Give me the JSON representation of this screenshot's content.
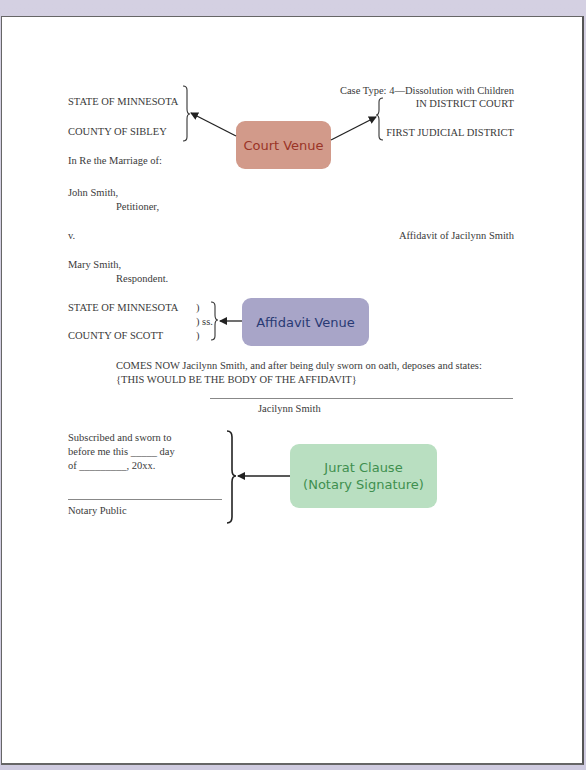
{
  "caption": {
    "case_type": "Case Type: 4—Dissolution with Children",
    "court": "IN DISTRICT COURT",
    "district": "FIRST JUDICIAL DISTRICT",
    "state": "STATE OF MINNESOTA",
    "county": "COUNTY OF SIBLEY",
    "in_re": "In Re the Marriage of:",
    "petitioner_name": "John Smith,",
    "petitioner_role": "Petitioner,",
    "versus": "v.",
    "respondent_name": "Mary Smith,",
    "respondent_role": "Respondent.",
    "document_title": "Affidavit of Jacilynn Smith"
  },
  "affidavit_venue": {
    "state": "STATE OF MINNESOTA",
    "county": "COUNTY OF SCOTT",
    "paren_top": ")",
    "ss": ") ss.",
    "paren_bottom": ")"
  },
  "body": {
    "line1": "COMES NOW Jacilynn Smith, and after being duly sworn on oath, deposes and states:",
    "line2": "{THIS WOULD BE THE BODY OF THE AFFIDAVIT}",
    "signer": "Jacilynn Smith"
  },
  "jurat": {
    "line1": "Subscribed and sworn to",
    "line2": "before me this _____ day",
    "line3": "of _________, 20xx.",
    "notary": "Notary Public"
  },
  "callouts": {
    "court_venue": "Court Venue",
    "affidavit_venue": "Affidavit Venue",
    "jurat_line1": "Jurat Clause",
    "jurat_line2": "(Notary Signature)"
  },
  "colors": {
    "court_venue_bg": "#d29a8a",
    "court_venue_text": "#9a3427",
    "affidavit_venue_bg": "#a8a5c8",
    "affidavit_venue_text": "#283a74",
    "jurat_bg": "#b9dfc1",
    "jurat_text": "#3f8f4f"
  }
}
